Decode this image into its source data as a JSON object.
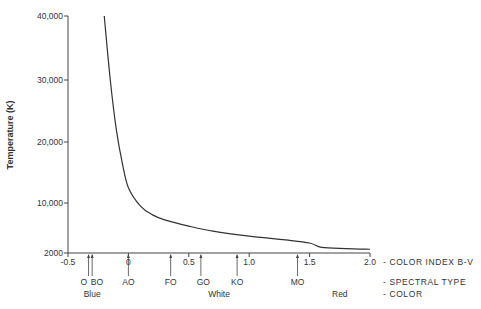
{
  "chart_data": {
    "type": "line",
    "title": "",
    "xlabel": "Color Index B-V",
    "ylabel": "Temperature (K)",
    "xlim": [
      -0.5,
      2.0
    ],
    "ylim": [
      2000,
      40000
    ],
    "grid": false,
    "legend": null,
    "y_ticks": [
      "40,000",
      "30,000",
      "20,000",
      "10,000",
      "2000"
    ],
    "x_ticks": [
      "-0.5",
      "0",
      "0.5",
      "1.0",
      "1.5",
      "2.0"
    ],
    "series": [
      {
        "name": "Temperature vs B-V",
        "x": [
          -0.2,
          -0.15,
          -0.1,
          -0.05,
          0.0,
          0.1,
          0.2,
          0.3,
          0.5,
          0.7,
          1.0,
          1.3,
          1.5,
          1.6,
          1.8,
          2.0
        ],
        "y": [
          40000,
          30000,
          22000,
          16500,
          12500,
          9500,
          8100,
          7300,
          6300,
          5500,
          4700,
          4100,
          3600,
          2900,
          2700,
          2600
        ]
      }
    ],
    "spectral_types": [
      {
        "label": "O",
        "b_v": -0.33
      },
      {
        "label": "BO",
        "b_v": -0.3
      },
      {
        "label": "AO",
        "b_v": 0.0
      },
      {
        "label": "FO",
        "b_v": 0.35
      },
      {
        "label": "GO",
        "b_v": 0.6
      },
      {
        "label": "KO",
        "b_v": 0.9
      },
      {
        "label": "MO",
        "b_v": 1.4
      }
    ],
    "colors": [
      {
        "label": "Blue",
        "b_v": -0.3
      },
      {
        "label": "White",
        "b_v": 0.75
      },
      {
        "label": "Red",
        "b_v": 1.75
      }
    ],
    "row_labels": [
      "- COLOR INDEX B-V",
      "- SPECTRAL TYPE",
      "- COLOR"
    ]
  }
}
